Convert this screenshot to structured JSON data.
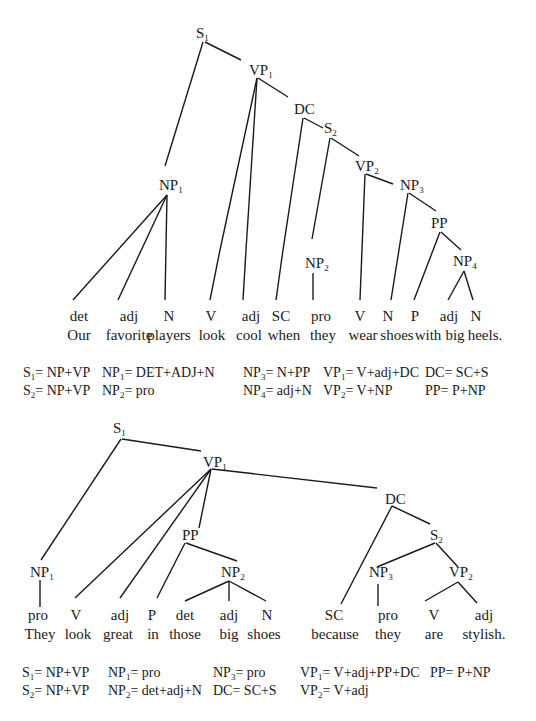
{
  "tree1": {
    "sentence": "Our favorite players look cool when they wear shoes with big heels.",
    "nodes": {
      "S1": {
        "base": "S",
        "sub": "1"
      },
      "VP1": {
        "base": "VP",
        "sub": "1"
      },
      "DC": {
        "base": "DC",
        "sub": ""
      },
      "S2": {
        "base": "S",
        "sub": "2"
      },
      "VP2": {
        "base": "VP",
        "sub": "2"
      },
      "NP1": {
        "base": "NP",
        "sub": "1"
      },
      "NP2": {
        "base": "NP",
        "sub": "2"
      },
      "NP3": {
        "base": "NP",
        "sub": "3"
      },
      "PP": {
        "base": "PP",
        "sub": ""
      },
      "NP4": {
        "base": "NP",
        "sub": "4"
      }
    },
    "leaves": [
      {
        "tag": "det",
        "word": "Our"
      },
      {
        "tag": "adj",
        "word": "favorite"
      },
      {
        "tag": "N",
        "word": "players"
      },
      {
        "tag": "V",
        "word": "look"
      },
      {
        "tag": "adj",
        "word": "cool"
      },
      {
        "tag": "SC",
        "word": "when"
      },
      {
        "tag": "pro",
        "word": "they"
      },
      {
        "tag": "V",
        "word": "wear"
      },
      {
        "tag": "N",
        "word": "shoes"
      },
      {
        "tag": "P",
        "word": "with"
      },
      {
        "tag": "adj",
        "word": "big"
      },
      {
        "tag": "N",
        "word": "heels."
      }
    ],
    "rules": [
      {
        "base": "S",
        "sub": "1",
        "rhs": "= NP+VP"
      },
      {
        "base": "NP",
        "sub": "1",
        "rhs": "= DET+ADJ+N"
      },
      {
        "base": "NP",
        "sub": "3",
        "rhs": "= N+PP"
      },
      {
        "base": "VP",
        "sub": "1",
        "rhs": "= V+adj+DC"
      },
      {
        "base": "DC",
        "sub": "",
        "rhs": "= SC+S"
      },
      {
        "base": "S",
        "sub": "2",
        "rhs": "= NP+VP"
      },
      {
        "base": "NP",
        "sub": "2",
        "rhs": "= pro"
      },
      {
        "base": "NP",
        "sub": "4",
        "rhs": "= adj+N"
      },
      {
        "base": "VP",
        "sub": "2",
        "rhs": "= V+NP"
      },
      {
        "base": "PP",
        "sub": "",
        "rhs": "= P+NP"
      }
    ]
  },
  "tree2": {
    "sentence": "They look great in those big shoes because they are stylish.",
    "nodes": {
      "S1": {
        "base": "S",
        "sub": "1"
      },
      "VP1": {
        "base": "VP",
        "sub": "1"
      },
      "DC": {
        "base": "DC",
        "sub": ""
      },
      "S2": {
        "base": "S",
        "sub": "2"
      },
      "PP": {
        "base": "PP",
        "sub": ""
      },
      "NP1": {
        "base": "NP",
        "sub": "1"
      },
      "NP2": {
        "base": "NP",
        "sub": "2"
      },
      "NP3": {
        "base": "NP",
        "sub": "3"
      },
      "VP2": {
        "base": "VP",
        "sub": "2"
      }
    },
    "leaves": [
      {
        "tag": "pro",
        "word": "They"
      },
      {
        "tag": "V",
        "word": "look"
      },
      {
        "tag": "adj",
        "word": "great"
      },
      {
        "tag": "P",
        "word": "in"
      },
      {
        "tag": "det",
        "word": "those"
      },
      {
        "tag": "adj",
        "word": "big"
      },
      {
        "tag": "N",
        "word": "shoes"
      },
      {
        "tag": "SC",
        "word": "because"
      },
      {
        "tag": "pro",
        "word": "they"
      },
      {
        "tag": "V",
        "word": "are"
      },
      {
        "tag": "adj",
        "word": "stylish."
      }
    ],
    "rules": [
      {
        "base": "S",
        "sub": "1",
        "rhs": "= NP+VP"
      },
      {
        "base": "NP",
        "sub": "1",
        "rhs": "= pro"
      },
      {
        "base": "NP",
        "sub": "3",
        "rhs": "= pro"
      },
      {
        "base": "VP",
        "sub": "1",
        "rhs": "= V+adj+PP+DC"
      },
      {
        "base": "PP",
        "sub": "",
        "rhs": "= P+NP"
      },
      {
        "base": "S",
        "sub": "2",
        "rhs": "= NP+VP"
      },
      {
        "base": "NP",
        "sub": "2",
        "rhs": "= det+adj+N"
      },
      {
        "base": "DC",
        "sub": "",
        "rhs": "= SC+S"
      },
      {
        "base": "VP",
        "sub": "2",
        "rhs": "= V+adj"
      }
    ]
  }
}
